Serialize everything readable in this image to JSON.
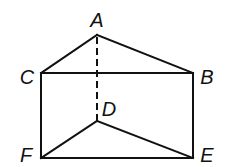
{
  "diagram": {
    "type": "triangular-prism",
    "stroke_color": "#111111",
    "background": "#ffffff",
    "vertices": [
      {
        "id": "A",
        "label": "A",
        "x": 97,
        "y": 35,
        "label_x": 97,
        "label_y": 27
      },
      {
        "id": "B",
        "label": "B",
        "x": 193,
        "y": 73,
        "label_x": 207,
        "label_y": 84
      },
      {
        "id": "C",
        "label": "C",
        "x": 41,
        "y": 73,
        "label_x": 27,
        "label_y": 84
      },
      {
        "id": "D",
        "label": "D",
        "x": 97,
        "y": 121,
        "label_x": 109,
        "label_y": 116
      },
      {
        "id": "E",
        "label": "E",
        "x": 193,
        "y": 158,
        "label_x": 207,
        "label_y": 162
      },
      {
        "id": "F",
        "label": "F",
        "x": 41,
        "y": 158,
        "label_x": 26,
        "label_y": 162
      }
    ],
    "edges": [
      {
        "from": "A",
        "to": "C",
        "style": "solid"
      },
      {
        "from": "A",
        "to": "B",
        "style": "solid"
      },
      {
        "from": "C",
        "to": "B",
        "style": "solid"
      },
      {
        "from": "C",
        "to": "F",
        "style": "solid"
      },
      {
        "from": "B",
        "to": "E",
        "style": "solid"
      },
      {
        "from": "F",
        "to": "E",
        "style": "solid"
      },
      {
        "from": "D",
        "to": "F",
        "style": "solid"
      },
      {
        "from": "D",
        "to": "E",
        "style": "solid"
      },
      {
        "from": "A",
        "to": "D",
        "style": "dashed"
      }
    ]
  }
}
